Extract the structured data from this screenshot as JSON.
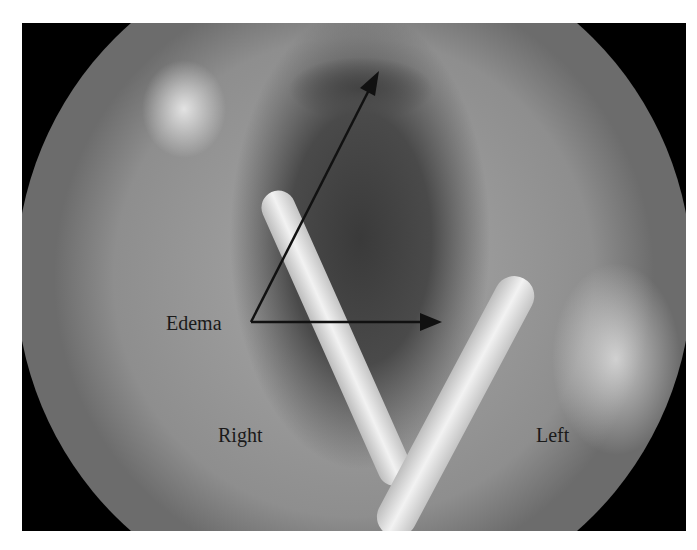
{
  "figure": {
    "labels": {
      "edema": "Edema",
      "right": "Right",
      "left": "Left"
    },
    "colors": {
      "background": "#ffffff",
      "frame": "#000000",
      "annotation": "#111111"
    }
  }
}
